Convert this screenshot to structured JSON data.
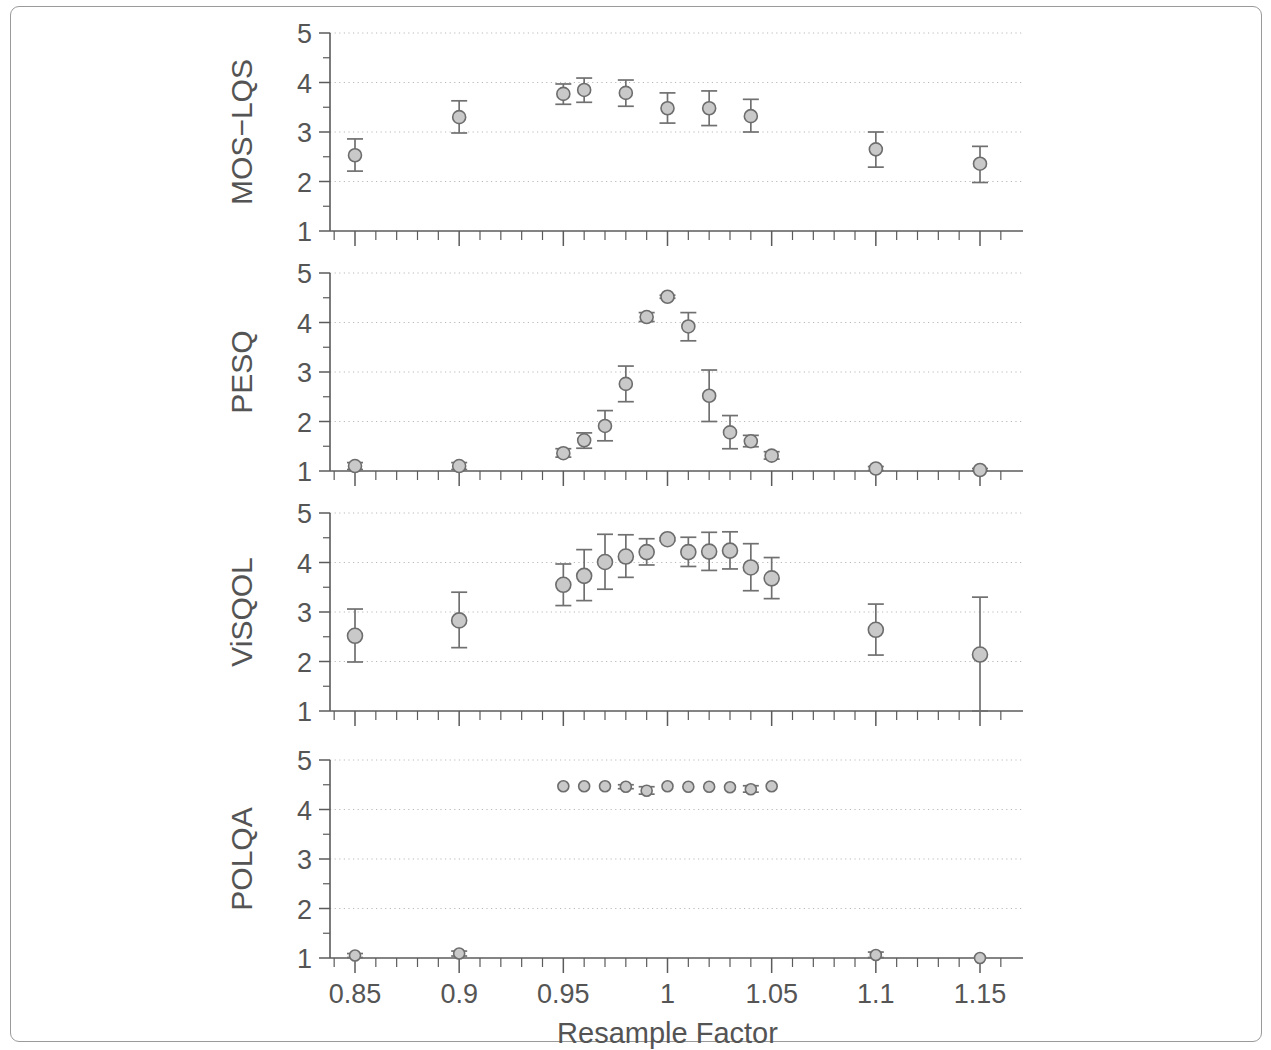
{
  "figure": {
    "xlabel": "Resample Factor",
    "xtick_labels": [
      "0.85",
      "0.9",
      "0.95",
      "1",
      "1.05",
      "1.1",
      "1.15"
    ],
    "xtick_values": [
      0.85,
      0.9,
      0.95,
      1.0,
      1.05,
      1.1,
      1.15
    ],
    "ytick_labels": [
      "1",
      "2",
      "3",
      "4",
      "5"
    ],
    "ytick_values": [
      1,
      2,
      3,
      4,
      5
    ],
    "panel_titles": [
      "MOS−LQS",
      "PESQ",
      "ViSQOL",
      "POLQA"
    ],
    "colors": {
      "marker_fill": "#c9c9c9",
      "marker_stroke": "#6d6d6d",
      "axis": "#5b5b5b",
      "grid": "#b9b9b9",
      "text": "#545454",
      "frame": "#9a9a9a",
      "background": "#ffffff"
    }
  },
  "chart_data": [
    {
      "type": "scatter",
      "title": "MOS−LQS",
      "ylabel": "MOS−LQS",
      "xlabel": "Resample Factor",
      "xlim": [
        0.838,
        1.162
      ],
      "ylim": [
        1,
        5
      ],
      "grid": true,
      "legend": "none",
      "errorbars": true,
      "x": [
        0.85,
        0.9,
        0.95,
        0.96,
        0.98,
        1.0,
        1.02,
        1.04,
        1.1,
        1.15
      ],
      "y": [
        2.53,
        3.3,
        3.77,
        3.85,
        3.79,
        3.48,
        3.48,
        3.32,
        2.65,
        2.36
      ],
      "yerr_low": [
        2.21,
        2.98,
        3.56,
        3.6,
        3.52,
        3.18,
        3.13,
        3.0,
        2.29,
        1.98
      ],
      "yerr_high": [
        2.86,
        3.63,
        3.97,
        4.09,
        4.05,
        3.79,
        3.83,
        3.66,
        3.0,
        2.71
      ]
    },
    {
      "type": "scatter",
      "title": "PESQ",
      "ylabel": "PESQ",
      "xlabel": "Resample Factor",
      "xlim": [
        0.838,
        1.162
      ],
      "ylim": [
        1,
        5
      ],
      "grid": true,
      "legend": "none",
      "errorbars": true,
      "x": [
        0.85,
        0.9,
        0.95,
        0.96,
        0.97,
        0.98,
        0.99,
        1.0,
        1.01,
        1.02,
        1.03,
        1.04,
        1.05,
        1.1,
        1.15
      ],
      "y": [
        1.1,
        1.1,
        1.36,
        1.62,
        1.91,
        2.76,
        4.11,
        4.52,
        3.92,
        2.52,
        1.78,
        1.6,
        1.31,
        1.05,
        1.02
      ],
      "yerr_low": [
        1.03,
        1.03,
        1.28,
        1.46,
        1.61,
        2.4,
        4.02,
        4.49,
        3.63,
        2.0,
        1.45,
        1.49,
        1.24,
        1.01,
        1.0
      ],
      "yerr_high": [
        1.17,
        1.17,
        1.45,
        1.77,
        2.22,
        3.12,
        4.2,
        4.55,
        4.2,
        3.04,
        2.12,
        1.72,
        1.39,
        1.09,
        1.05
      ]
    },
    {
      "type": "scatter",
      "title": "ViSQOL",
      "ylabel": "ViSQOL",
      "xlabel": "Resample Factor",
      "xlim": [
        0.838,
        1.162
      ],
      "ylim": [
        1,
        5
      ],
      "grid": true,
      "legend": "none",
      "errorbars": true,
      "x": [
        0.85,
        0.9,
        0.95,
        0.96,
        0.97,
        0.98,
        0.99,
        1.0,
        1.01,
        1.02,
        1.03,
        1.04,
        1.05,
        1.1,
        1.15
      ],
      "y": [
        2.52,
        2.83,
        3.55,
        3.73,
        4.01,
        4.12,
        4.21,
        4.47,
        4.21,
        4.22,
        4.24,
        3.9,
        3.68,
        2.64,
        2.14
      ],
      "yerr_low": [
        1.99,
        2.28,
        3.13,
        3.23,
        3.46,
        3.7,
        3.95,
        4.44,
        3.92,
        3.84,
        3.87,
        3.43,
        3.27,
        2.13,
        1.0
      ],
      "yerr_high": [
        3.06,
        3.4,
        3.97,
        4.26,
        4.57,
        4.56,
        4.48,
        4.5,
        4.51,
        4.61,
        4.62,
        4.38,
        4.1,
        3.16,
        3.3
      ]
    },
    {
      "type": "scatter",
      "title": "POLQA",
      "ylabel": "POLQA",
      "xlabel": "Resample Factor",
      "xlim": [
        0.838,
        1.162
      ],
      "ylim": [
        1,
        5
      ],
      "grid": true,
      "legend": "none",
      "errorbars": true,
      "x": [
        0.85,
        0.9,
        0.95,
        0.96,
        0.97,
        0.98,
        0.99,
        1.0,
        1.01,
        1.02,
        1.03,
        1.04,
        1.05,
        1.1,
        1.15
      ],
      "y": [
        1.05,
        1.09,
        4.47,
        4.47,
        4.47,
        4.46,
        4.38,
        4.47,
        4.46,
        4.46,
        4.45,
        4.41,
        4.47,
        1.06,
        1.0
      ],
      "yerr_low": [
        1.01,
        1.04,
        4.47,
        4.47,
        4.47,
        4.42,
        4.31,
        4.47,
        4.46,
        4.46,
        4.45,
        4.35,
        4.47,
        1.01,
        1.0
      ],
      "yerr_high": [
        1.09,
        1.14,
        4.47,
        4.47,
        4.47,
        4.5,
        4.46,
        4.47,
        4.46,
        4.46,
        4.45,
        4.48,
        4.47,
        1.12,
        1.0
      ]
    }
  ]
}
